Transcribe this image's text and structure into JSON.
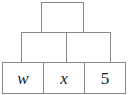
{
  "figure": {
    "name": "number-pyramid",
    "line_color": "#8a8a8a",
    "text_color": "#1b1b1b",
    "background_color": "#ffffff"
  },
  "tiers": [
    {
      "name": "top",
      "cells": [
        {
          "name": "apex",
          "label": "",
          "style": "empty"
        }
      ]
    },
    {
      "name": "middle",
      "cells": [
        {
          "name": "middle-left",
          "label": "",
          "style": "empty"
        },
        {
          "name": "middle-right",
          "label": "",
          "style": "empty"
        }
      ]
    },
    {
      "name": "bottom",
      "cells": [
        {
          "name": "bottom-w",
          "label": "w",
          "style": "variable"
        },
        {
          "name": "bottom-x",
          "label": "x",
          "style": "variable"
        },
        {
          "name": "bottom-5",
          "label": "5",
          "style": "number"
        }
      ]
    }
  ]
}
